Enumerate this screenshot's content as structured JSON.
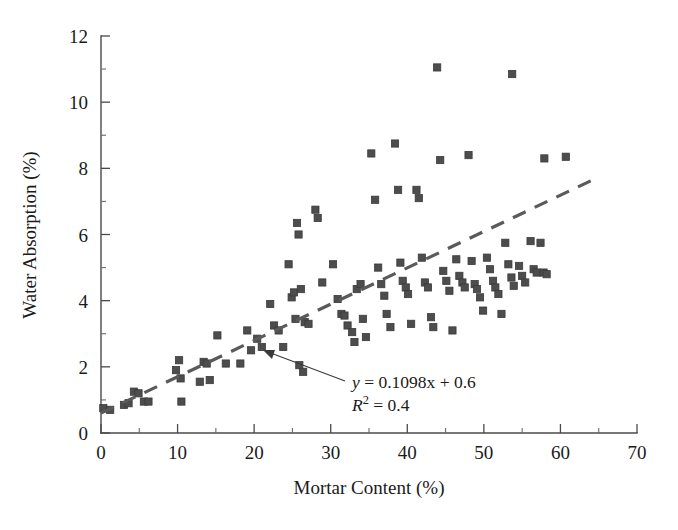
{
  "chart_data": {
    "type": "scatter",
    "title": "",
    "xlabel": "Mortar Content (%)",
    "ylabel": "Water Absorption (%)",
    "xlim": [
      0,
      70
    ],
    "ylim": [
      0,
      12
    ],
    "xticks": [
      0,
      10,
      20,
      30,
      40,
      50,
      60,
      70
    ],
    "yticks": [
      0,
      2,
      4,
      6,
      8,
      10,
      12
    ],
    "xtick_labels": [
      "0",
      "10",
      "20",
      "30",
      "40",
      "50",
      "60",
      "70"
    ],
    "ytick_labels": [
      "0",
      "2",
      "4",
      "6",
      "8",
      "10",
      "12"
    ],
    "x_minor_interval": 5,
    "y_minor_interval": 1,
    "grid": false,
    "legend": "none",
    "marker_style": "square",
    "marker_color": "#4d4d4d",
    "series": [
      {
        "name": "Water Absorption vs Mortar Content",
        "points": [
          [
            0.3,
            0.75
          ],
          [
            1.2,
            0.7
          ],
          [
            3.0,
            0.85
          ],
          [
            3.6,
            0.9
          ],
          [
            4.3,
            1.25
          ],
          [
            4.9,
            1.2
          ],
          [
            5.6,
            0.95
          ],
          [
            6.2,
            0.95
          ],
          [
            9.8,
            1.9
          ],
          [
            10.2,
            2.2
          ],
          [
            10.4,
            1.65
          ],
          [
            10.5,
            0.95
          ],
          [
            12.9,
            1.55
          ],
          [
            13.4,
            2.15
          ],
          [
            13.8,
            2.1
          ],
          [
            14.2,
            1.6
          ],
          [
            15.2,
            2.95
          ],
          [
            16.3,
            2.1
          ],
          [
            18.2,
            2.1
          ],
          [
            19.1,
            3.1
          ],
          [
            19.6,
            2.5
          ],
          [
            20.4,
            2.85
          ],
          [
            21.0,
            2.6
          ],
          [
            22.1,
            3.9
          ],
          [
            22.6,
            3.25
          ],
          [
            23.2,
            3.1
          ],
          [
            23.8,
            2.6
          ],
          [
            24.5,
            5.1
          ],
          [
            24.9,
            4.1
          ],
          [
            25.2,
            4.25
          ],
          [
            25.4,
            3.45
          ],
          [
            25.6,
            6.35
          ],
          [
            25.8,
            6.0
          ],
          [
            25.9,
            2.05
          ],
          [
            26.1,
            4.35
          ],
          [
            26.4,
            1.85
          ],
          [
            26.6,
            3.35
          ],
          [
            27.1,
            3.3
          ],
          [
            28.0,
            6.75
          ],
          [
            28.3,
            6.5
          ],
          [
            28.9,
            4.55
          ],
          [
            30.3,
            5.1
          ],
          [
            30.9,
            4.05
          ],
          [
            31.4,
            3.6
          ],
          [
            31.8,
            3.55
          ],
          [
            32.2,
            3.25
          ],
          [
            32.8,
            3.05
          ],
          [
            33.1,
            2.75
          ],
          [
            33.4,
            4.35
          ],
          [
            33.9,
            4.5
          ],
          [
            34.2,
            3.45
          ],
          [
            34.6,
            2.9
          ],
          [
            35.3,
            8.45
          ],
          [
            35.8,
            7.05
          ],
          [
            36.2,
            5.0
          ],
          [
            36.6,
            4.5
          ],
          [
            37.0,
            4.15
          ],
          [
            37.3,
            3.6
          ],
          [
            37.8,
            3.2
          ],
          [
            38.4,
            8.75
          ],
          [
            38.8,
            7.35
          ],
          [
            39.1,
            5.15
          ],
          [
            39.4,
            4.6
          ],
          [
            39.8,
            4.4
          ],
          [
            40.1,
            4.2
          ],
          [
            40.5,
            3.3
          ],
          [
            41.2,
            7.35
          ],
          [
            41.5,
            7.1
          ],
          [
            41.9,
            5.3
          ],
          [
            42.3,
            4.55
          ],
          [
            42.7,
            4.4
          ],
          [
            43.1,
            3.5
          ],
          [
            43.4,
            3.2
          ],
          [
            43.9,
            11.05
          ],
          [
            44.3,
            8.25
          ],
          [
            44.7,
            4.9
          ],
          [
            45.1,
            4.6
          ],
          [
            45.5,
            4.3
          ],
          [
            45.9,
            3.1
          ],
          [
            46.4,
            5.25
          ],
          [
            46.8,
            4.75
          ],
          [
            47.2,
            4.55
          ],
          [
            47.5,
            4.4
          ],
          [
            48.0,
            8.4
          ],
          [
            48.4,
            5.2
          ],
          [
            48.8,
            4.5
          ],
          [
            49.1,
            4.35
          ],
          [
            49.5,
            4.1
          ],
          [
            49.9,
            3.7
          ],
          [
            50.4,
            5.3
          ],
          [
            50.8,
            4.95
          ],
          [
            51.2,
            4.6
          ],
          [
            51.5,
            4.4
          ],
          [
            51.9,
            4.2
          ],
          [
            52.3,
            3.6
          ],
          [
            52.8,
            5.75
          ],
          [
            53.2,
            5.1
          ],
          [
            53.6,
            4.7
          ],
          [
            53.9,
            4.45
          ],
          [
            53.7,
            10.85
          ],
          [
            54.6,
            5.05
          ],
          [
            55.0,
            4.75
          ],
          [
            55.4,
            4.55
          ],
          [
            56.1,
            5.8
          ],
          [
            56.5,
            4.95
          ],
          [
            56.9,
            4.85
          ],
          [
            57.4,
            5.75
          ],
          [
            57.8,
            4.85
          ],
          [
            58.2,
            4.8
          ],
          [
            57.9,
            8.3
          ],
          [
            60.7,
            8.35
          ]
        ]
      }
    ],
    "trendline": {
      "equation_text": "y = 0.1098x + 0.6",
      "r2_text": "R2 = 0.4",
      "slope": 0.1098,
      "intercept": 0.6,
      "r_squared": 0.4,
      "style": "dashed",
      "x_start": 0,
      "x_end": 65
    },
    "annotation": {
      "equation_display": "y = 0.1098x + 0.6",
      "r_label": "R",
      "r_exponent": "2",
      "r_value": " = 0.4",
      "y_symbol": "y",
      "equation_rest": " = 0.1098x + 0.6",
      "has_arrow": true,
      "arrow_target_x": 20.9,
      "arrow_target_y": 2.82
    }
  }
}
